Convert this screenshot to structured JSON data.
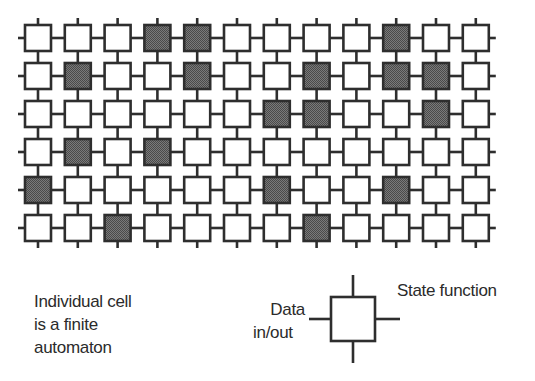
{
  "diagram": {
    "grid": {
      "rows": 6,
      "cols": 12,
      "origin_x": 25,
      "origin_y": 25,
      "pitch_x": 39.8,
      "pitch_y": 38,
      "cell_size": 26,
      "stub_length": 7,
      "shaded_cells": [
        [
          3,
          4,
          9
        ],
        [
          1,
          4,
          7,
          9,
          10
        ],
        [
          6,
          7,
          10
        ],
        [
          1,
          3
        ],
        [
          0,
          6,
          9
        ],
        [
          2,
          7
        ]
      ]
    },
    "colors": {
      "line": "#2e2e2e",
      "cell_fill": "#ffffff",
      "shaded_fill": "#6b6b6b",
      "background": "#ffffff"
    },
    "legend_cell": {
      "center_x": 353,
      "center_y": 319,
      "size": 44,
      "stub_length": 22
    },
    "caption": {
      "lines": [
        "Individual cell",
        "is a finite",
        "automaton"
      ]
    },
    "labels": {
      "state_function": "State function",
      "data_line1": "Data",
      "data_line2": "in/out"
    }
  }
}
